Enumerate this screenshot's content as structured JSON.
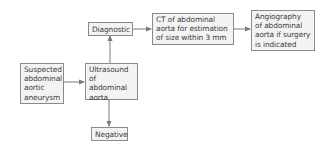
{
  "diagram": {
    "type": "flowchart",
    "nodes": {
      "suspected": {
        "label": "Suspected\nabdominal\naortic\naneurysm"
      },
      "ultrasound": {
        "label": "Ultrasound\nof abdominal\naorta"
      },
      "diagnostic": {
        "label": "Diagnostic"
      },
      "negative": {
        "label": "Negative"
      },
      "ct": {
        "label": "CT of abdominal\naorta for estimation\nof size within 3 mm"
      },
      "angiography": {
        "label": "Angiography\nof abdominal\naorta if surgery\nis indicated"
      }
    },
    "edges": [
      {
        "from": "suspected",
        "to": "ultrasound"
      },
      {
        "from": "ultrasound",
        "to": "diagnostic"
      },
      {
        "from": "ultrasound",
        "to": "negative"
      },
      {
        "from": "diagnostic",
        "to": "ct"
      },
      {
        "from": "ct",
        "to": "angiography"
      }
    ],
    "colors": {
      "border": "#8a8a8a",
      "fill": "#f3f3f3",
      "text": "#3a3a3a",
      "arrow": "#7a7a7a"
    }
  }
}
